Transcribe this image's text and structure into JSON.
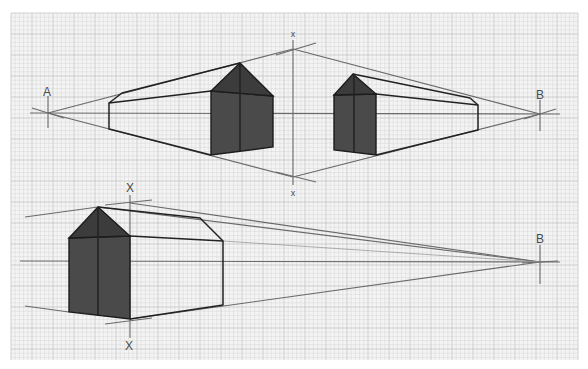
{
  "colors": {
    "paper": "#f4f4f4",
    "grid_minor": "#d6d6d6",
    "grid_major": "#bdbdbd",
    "construction_line": "#6a6a6a",
    "edge": "#222222",
    "shading": "#4a4a4a"
  },
  "top_diagram": {
    "vanishing_point_left": {
      "label": "A",
      "x": 48,
      "y": 113
    },
    "vanishing_point_right": {
      "label": "B",
      "x": 540,
      "y": 114
    },
    "vertical_axis": {
      "label_top": "x",
      "label_bottom": "x",
      "x": 293,
      "top_y": 49,
      "bottom_y": 177
    }
  },
  "bottom_diagram": {
    "vanishing_point_right": {
      "label": "B",
      "x": 540,
      "y": 262
    },
    "vertical_axis": {
      "label_top": "X",
      "label_bottom": "X",
      "x": 130,
      "top_y": 200,
      "bottom_y": 320
    }
  }
}
